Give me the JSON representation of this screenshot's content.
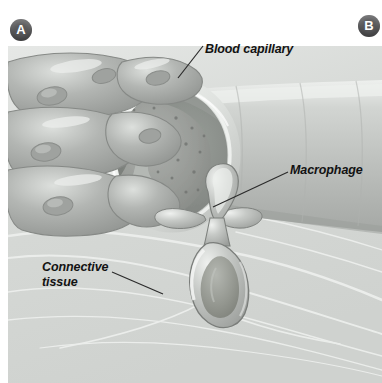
{
  "figure": {
    "width": 382,
    "height": 383,
    "background_color": "#ffffff"
  },
  "panels": [
    {
      "id": "A",
      "badge_label": "A",
      "badge_color": "#58585a",
      "text_color": "#ffffff"
    },
    {
      "id": "B",
      "badge_label": "B",
      "badge_color": "#58585a",
      "text_color": "#ffffff"
    }
  ],
  "labels": {
    "blood_capillary": "Blood capillary",
    "macrophage": "Macrophage",
    "connective_tissue": "Connective\ntissue"
  },
  "leader_lines": {
    "blood_capillary": {
      "x1": 203,
      "y1": 46,
      "x2": 178,
      "y2": 78,
      "color": "#2b2b2b"
    },
    "macrophage": {
      "x1": 288,
      "y1": 172,
      "x2": 213,
      "y2": 207,
      "color": "#2b2b2b"
    },
    "connective_tissue": {
      "x1": 112,
      "y1": 272,
      "x2": 163,
      "y2": 294,
      "color": "#2b2b2b"
    }
  },
  "colors": {
    "background": "#ffffff",
    "connective_tissue_fill": "#d4d6d4",
    "connective_tissue_fiber": "#eceeec",
    "capillary_tube": "#c3c6c3",
    "capillary_wall_rim": "#e8eae8",
    "endothelial_cell": "#a9aca9",
    "endothelial_cell_highlight": "#d9dcd9",
    "lumen_interior": "#8c8f8c",
    "lumen_inner_wall": "#9a9d9a",
    "macrophage_body": "#b7bab7",
    "macrophage_highlight": "#e6e8e6",
    "macrophage_core": "#93968f",
    "outline": "#6f726f",
    "label_text": "#121212"
  },
  "structures": [
    {
      "name": "blood-capillary-tube",
      "description": "cut-open capillary running from lower-left to right edge"
    },
    {
      "name": "capillary-lumen",
      "description": "dark open end of the capillary showing fenestrated inner wall with pores"
    },
    {
      "name": "endothelial-cells",
      "description": "bulging rounded cells with visible nuclei forming the capillary wall"
    },
    {
      "name": "macrophage",
      "description": "cell squeezing through the capillary wall, upper lobe inside, larger lobe outside"
    },
    {
      "name": "connective-tissue",
      "description": "light fibrous ground substance surrounding the capillary"
    }
  ]
}
